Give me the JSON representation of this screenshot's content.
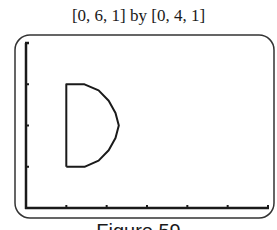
{
  "title": "[0, 6, 1] by [0, 4, 1]",
  "caption": "Figure 59",
  "colors": {
    "ink": "#1a1a1a",
    "frame": "#333333",
    "background": "#ffffff"
  },
  "chart_data": {
    "type": "line",
    "title": "[0, 6, 1] by [0, 4, 1]",
    "window": {
      "xmin": 0,
      "xmax": 6,
      "xscl": 1,
      "ymin": 0,
      "ymax": 4,
      "yscl": 1
    },
    "xlabel": "",
    "ylabel": "",
    "xlim": [
      0,
      6
    ],
    "ylim": [
      0,
      4
    ],
    "x_ticks": [
      1,
      2,
      3,
      4,
      5,
      6
    ],
    "y_ticks": [
      1,
      2,
      3
    ],
    "grid": false,
    "series": [
      {
        "name": "D-shaped curve",
        "description": "Vertical segment x=1 from y=1 to y=3, closed by a semicircular arc bulging right to about x=2.3 at y=2",
        "points": [
          [
            1.0,
            1.0
          ],
          [
            1.0,
            3.0
          ],
          [
            1.45,
            3.0
          ],
          [
            1.8,
            2.85
          ],
          [
            2.05,
            2.6
          ],
          [
            2.22,
            2.3
          ],
          [
            2.3,
            2.0
          ],
          [
            2.22,
            1.7
          ],
          [
            2.05,
            1.4
          ],
          [
            1.8,
            1.15
          ],
          [
            1.45,
            1.0
          ],
          [
            1.0,
            1.0
          ]
        ]
      }
    ]
  }
}
